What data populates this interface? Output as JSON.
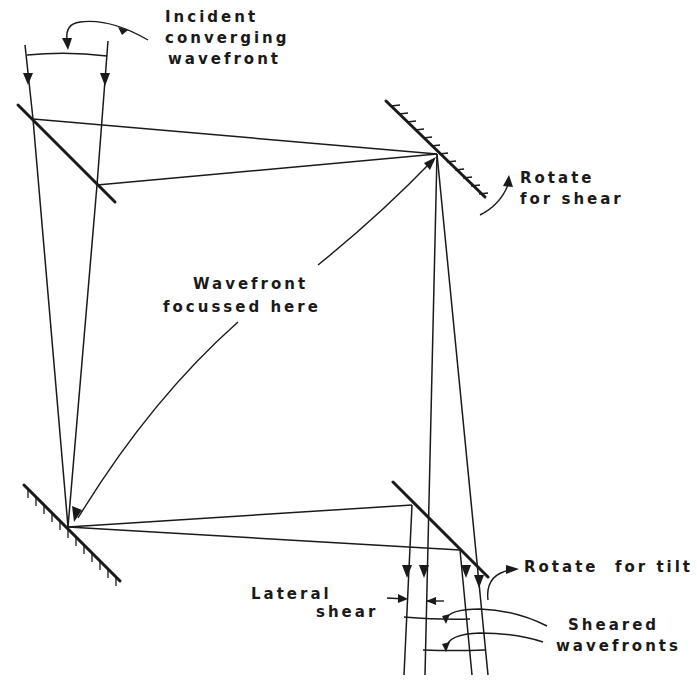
{
  "diagram": {
    "type": "optical-schematic",
    "labels": {
      "incident_line1": "Incident",
      "incident_line2": "converging",
      "incident_line3": "wavefront",
      "rotate_shear_line1": "Rotate",
      "rotate_shear_line2": "for shear",
      "focus_line1": "Wavefront",
      "focus_line2": "focussed here",
      "rotate_tilt": "Rotate  for tilt",
      "lateral_line1": "Lateral",
      "lateral_line2": "shear",
      "sheared_line1": "Sheared",
      "sheared_line2": "wavefronts"
    },
    "components": [
      {
        "id": "beam-splitter-entry",
        "kind": "beam splitter (plain line)"
      },
      {
        "id": "mirror-top-right",
        "kind": "mirror (hatched)",
        "annotation": "Rotate for shear"
      },
      {
        "id": "mirror-bottom-left",
        "kind": "mirror (hatched)"
      },
      {
        "id": "beam-splitter-exit",
        "kind": "beam splitter (plain line)",
        "annotation": "Rotate for tilt"
      }
    ],
    "colors": {
      "ink": "#1a1a1a",
      "background": "#ffffff"
    }
  }
}
